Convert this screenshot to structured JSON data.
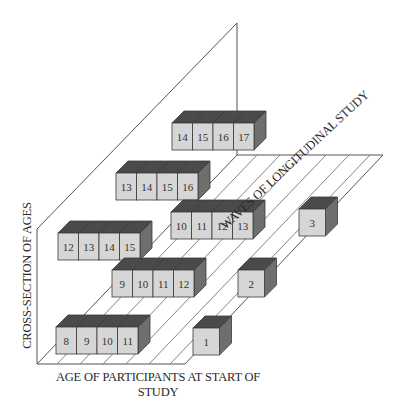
{
  "diagram": {
    "axes": {
      "x_label_line1": "AGE OF PARTICIPANTS AT START OF",
      "x_label_line2": "STUDY",
      "y_label": "CROSS-SECTION OF AGES",
      "z_label": "WAVES OF LONGITUDINAL STUDY"
    },
    "colors": {
      "face": "#d6d6d6",
      "top": "#4a4a4a",
      "side": "#6e6e6e",
      "edge": "#3a3a3a",
      "line": "#555555"
    },
    "waves": [
      {
        "wave": "1",
        "rows": [
          {
            "ages": [
              "8",
              "9",
              "10",
              "11"
            ]
          }
        ]
      },
      {
        "wave": "2",
        "rows": [
          {
            "ages": [
              "9",
              "10",
              "11",
              "12"
            ]
          },
          {
            "ages": [
              "12",
              "13",
              "14",
              "15"
            ]
          }
        ]
      },
      {
        "wave": "3",
        "rows": [
          {
            "ages": [
              "10",
              "11",
              "12",
              "13"
            ]
          },
          {
            "ages": [
              "13",
              "14",
              "15",
              "16"
            ]
          },
          {
            "ages": [
              "14",
              "15",
              "16",
              "17"
            ]
          }
        ]
      }
    ]
  }
}
